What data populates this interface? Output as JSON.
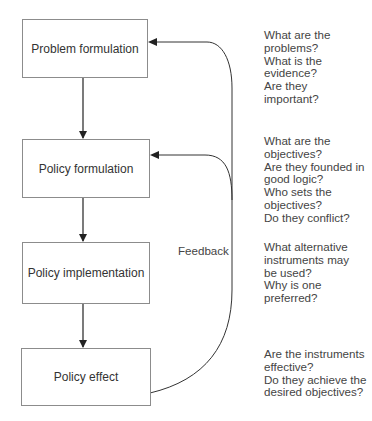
{
  "diagram": {
    "boxes": [
      {
        "id": "problem-formulation",
        "label": "Problem formulation"
      },
      {
        "id": "policy-formulation",
        "label": "Policy formulation"
      },
      {
        "id": "policy-implementation",
        "label": "Policy implementation"
      },
      {
        "id": "policy-effect",
        "label": "Policy effect"
      }
    ],
    "feedback_label": "Feedback",
    "questions": [
      {
        "lines": [
          "What are the",
          "problems?",
          "What is the",
          "evidence?",
          "Are they",
          "important?"
        ]
      },
      {
        "lines": [
          "What are the",
          "objectives?",
          "Are they founded in",
          "good logic?",
          "Who sets the",
          "objectives?",
          "Do they conflict?"
        ]
      },
      {
        "lines": [
          "What alternative",
          "instruments may",
          "be used?",
          "Why is one",
          "preferred?"
        ]
      },
      {
        "lines": [
          "Are the instruments",
          "effective?",
          "Do they achieve the",
          "desired objectives?"
        ]
      }
    ],
    "colors": {
      "line": "#222222",
      "box_border": "#8c8c8c",
      "text": "#333333"
    }
  }
}
